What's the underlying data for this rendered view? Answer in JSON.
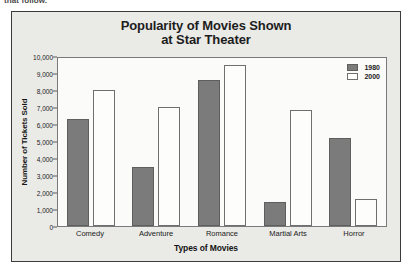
{
  "page_fragment": "that follow.",
  "chart_data": {
    "type": "bar",
    "title": "Popularity of Movies Shown at Star Theater",
    "title_line1": "Popularity of Movies Shown",
    "title_line2": "at Star Theater",
    "xlabel": "Types of Movies",
    "ylabel": "Number of Tickets Sold",
    "categories": [
      "Comedy",
      "Adventure",
      "Romance",
      "Martial Arts",
      "Horror"
    ],
    "series": [
      {
        "name": "1980",
        "color": "#7b7b7b",
        "values": [
          6300,
          3500,
          8600,
          1400,
          5200
        ]
      },
      {
        "name": "2000",
        "color": "#ffffff",
        "values": [
          8000,
          7000,
          9450,
          6800,
          1600
        ]
      }
    ],
    "ylim": [
      0,
      10000
    ],
    "ytick_step": 1000,
    "ytick_labels": [
      "10,000",
      "9,000",
      "8,000",
      "7,000",
      "6,000",
      "5,000",
      "4,000",
      "3,000",
      "2,000",
      "1,000",
      "0"
    ],
    "ytick_values": [
      10000,
      9000,
      8000,
      7000,
      6000,
      5000,
      4000,
      3000,
      2000,
      1000,
      0
    ],
    "grid": false,
    "legend_position": "top-right"
  }
}
